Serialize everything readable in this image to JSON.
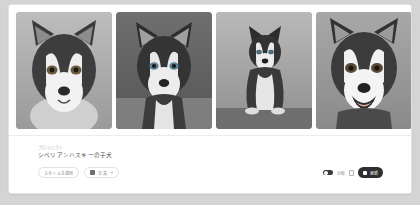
{
  "card": {
    "gallery": {
      "images": [
        {
          "alt": "husky-puppy-headshot-light-background"
        },
        {
          "alt": "husky-puppy-sitting-dark-background"
        },
        {
          "alt": "husky-puppy-full-body-sitting"
        },
        {
          "alt": "husky-puppy-smiling-closeup"
        }
      ]
    },
    "info": {
      "eyebrow": "プロジェクト",
      "title": "シベリアンハスキーの子犬"
    },
    "actions": {
      "style_button": "スタイルを適用",
      "export_button": "写真",
      "toggle_label": "比較",
      "primary_button": "更新"
    }
  },
  "colors": {
    "page_background": "#d4d4d4",
    "card_background": "#ffffff",
    "primary_button": "#2f2f2f",
    "title_text": "#4a4a4a",
    "muted_text": "#b3b3b3"
  }
}
